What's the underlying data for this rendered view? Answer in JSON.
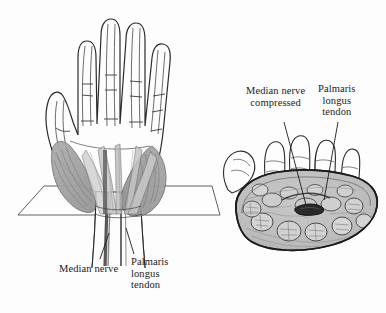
{
  "figure": {
    "background_color": "#fdfdfd",
    "ink_color": "#1b1b1b",
    "muscle_shade_color": "#9a9a9a",
    "tissue_shade_color": "#b5b5b5",
    "nerve_dark_color": "#2a2a2a"
  },
  "left_panel": {
    "name": "palmar-view-of-hand",
    "description": "Anterior view of right hand with thenar and hypothenar muscles shaded and a section plane crossing the wrist",
    "labels": {
      "median_nerve": "Median nerve",
      "palmaris_longus_tendon": {
        "line1": "Palmaris",
        "line2": "longus",
        "line3": "tendon"
      }
    }
  },
  "right_panel": {
    "name": "wrist-cross-section",
    "description": "Cross-section through the carpal tunnel showing flexor tendons and the flattened median nerve",
    "labels": {
      "median_nerve_compressed": {
        "line1": "Median nerve",
        "line2": "compressed"
      },
      "palmaris_longus_tendon": {
        "line1": "Palmaris",
        "line2": "longus",
        "line3": "tendon"
      }
    }
  }
}
